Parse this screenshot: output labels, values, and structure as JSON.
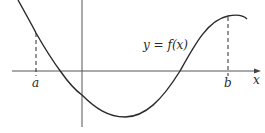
{
  "diagram": {
    "function_label": "y = f(x)",
    "x_axis_label": "x",
    "point_a_label": "a",
    "point_b_label": "b",
    "colors": {
      "stroke": "#2a2a2a",
      "background": "#ffffff"
    }
  }
}
